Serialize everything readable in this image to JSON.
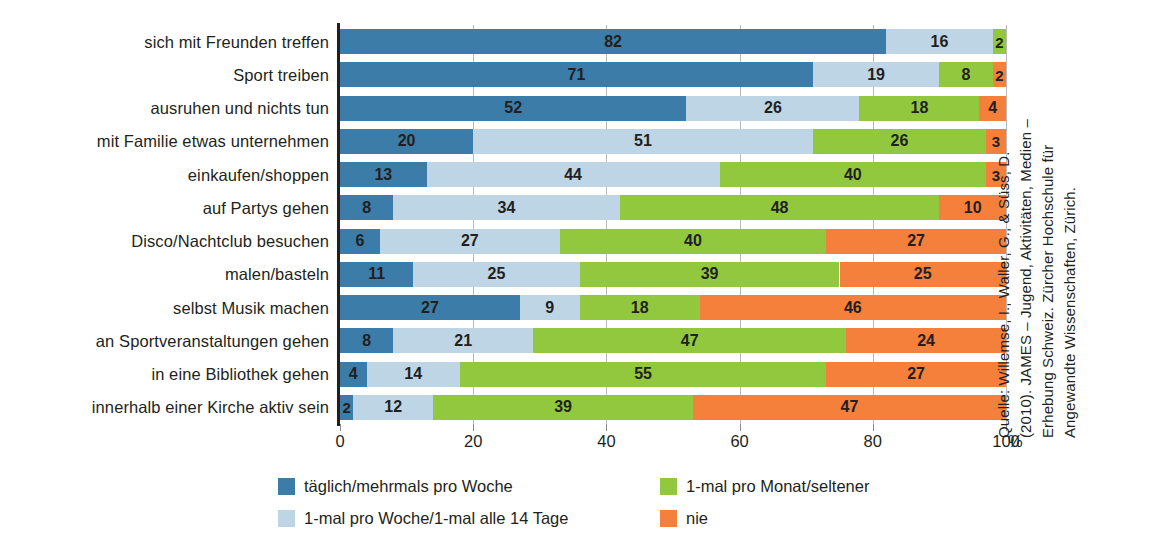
{
  "chart_data": {
    "type": "bar",
    "orientation": "horizontal",
    "stacked": true,
    "title": "",
    "xlabel": "%",
    "ylabel": "",
    "xlim": [
      0,
      100
    ],
    "xticks": [
      0,
      20,
      40,
      60,
      80,
      100
    ],
    "xticklabels": [
      "0",
      "20",
      "40",
      "60",
      "80",
      "100"
    ],
    "unit_suffix": "%",
    "grid": true,
    "legend_position": "bottom",
    "categories": [
      "sich mit Freunden treffen",
      "Sport treiben",
      "ausruhen und nichts tun",
      "mit Familie etwas unternehmen",
      "einkaufen/shoppen",
      "auf Partys gehen",
      "Disco/Nachtclub besuchen",
      "malen/basteln",
      "selbst Musik machen",
      "an Sportveranstaltungen gehen",
      "in eine Bibliothek gehen",
      "innerhalb einer Kirche aktiv sein"
    ],
    "series": [
      {
        "name": "täglich/mehrmals pro Woche",
        "color": "#3b7ca8",
        "values": [
          82,
          71,
          52,
          20,
          13,
          8,
          6,
          11,
          27,
          8,
          4,
          2
        ]
      },
      {
        "name": "1-mal pro Woche/1-mal alle 14 Tage",
        "color": "#bed5e5",
        "values": [
          16,
          19,
          26,
          51,
          44,
          34,
          27,
          25,
          9,
          21,
          14,
          12
        ]
      },
      {
        "name": "1-mal pro Monat/seltener",
        "color": "#92c83e",
        "values": [
          2,
          8,
          18,
          26,
          40,
          48,
          40,
          39,
          18,
          47,
          55,
          39
        ]
      },
      {
        "name": "nie",
        "color": "#f4803c",
        "values": [
          0,
          2,
          4,
          3,
          3,
          10,
          27,
          25,
          46,
          24,
          27,
          47
        ]
      }
    ]
  },
  "legend": {
    "items": [
      {
        "label": "täglich/mehrmals pro Woche",
        "color": "#3b7ca8"
      },
      {
        "label": "1-mal pro Woche/1-mal alle 14 Tage",
        "color": "#bed5e5"
      },
      {
        "label": "1-mal pro Monat/seltener",
        "color": "#92c83e"
      },
      {
        "label": "nie",
        "color": "#f4803c"
      }
    ]
  },
  "source": {
    "lines": [
      "Quelle: Willemse, I., Waller, G., & Süss, D.",
      "(2010). JAMES – Jugend, Aktivitäten, Medien –",
      "Erhebung Schweiz. Zürcher Hochschule für",
      "Angewandte Wissenschaften, Zürich."
    ]
  }
}
